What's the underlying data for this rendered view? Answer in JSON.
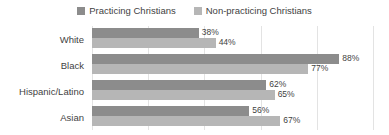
{
  "chart_data": {
    "type": "bar",
    "orientation": "horizontal",
    "title": "",
    "subtitle": "",
    "xlabel": "",
    "ylabel": "",
    "xlim": [
      0,
      100
    ],
    "grid": true,
    "gridline_values": [
      0,
      20,
      40,
      60,
      80,
      100
    ],
    "legend_position": "top-center",
    "value_suffix": "%",
    "categories": [
      "White",
      "Black",
      "Hispanic/Latino",
      "Asian"
    ],
    "series": [
      {
        "name": "Practicing Christians",
        "color": "#8c8c8c",
        "values": [
          38,
          88,
          62,
          56
        ],
        "labels": [
          "38%",
          "88%",
          "62%",
          "56%"
        ]
      },
      {
        "name": "Non-practicing Christians",
        "color": "#b6b6b6",
        "values": [
          44,
          77,
          65,
          67
        ],
        "labels": [
          "44%",
          "77%",
          "65%",
          "67%"
        ]
      }
    ]
  },
  "legend": {
    "entries": [
      {
        "label": "Practicing Christians",
        "color": "#8c8c8c"
      },
      {
        "label": "Non-practicing Christians",
        "color": "#b6b6b6"
      }
    ]
  },
  "axis": {
    "categories": [
      {
        "label": "White"
      },
      {
        "label": "Black"
      },
      {
        "label": "Hispanic/Latino"
      },
      {
        "label": "Asian"
      }
    ]
  },
  "rows": [
    {
      "category": "White",
      "practicing": {
        "value": 38,
        "label": "38%"
      },
      "nonpracticing": {
        "value": 44,
        "label": "44%"
      }
    },
    {
      "category": "Black",
      "practicing": {
        "value": 88,
        "label": "88%"
      },
      "nonpracticing": {
        "value": 77,
        "label": "77%"
      }
    },
    {
      "category": "Hispanic/Latino",
      "practicing": {
        "value": 62,
        "label": "62%"
      },
      "nonpracticing": {
        "value": 65,
        "label": "65%"
      }
    },
    {
      "category": "Asian",
      "practicing": {
        "value": 56,
        "label": "56%"
      },
      "nonpracticing": {
        "value": 67,
        "label": "67%"
      }
    }
  ]
}
